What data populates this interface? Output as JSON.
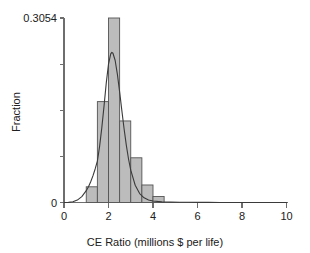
{
  "figure": {
    "background_color": "#ffffff",
    "bar_fill_color": "#bcbcbc",
    "bar_edge_color": "#545454",
    "curve_color": "#3a3a3a",
    "axis_color": "#6e6e6e"
  },
  "axes": {
    "x_title": "CE Ratio (millions $ per life)",
    "y_title": "Fraction",
    "x_ticks": [
      {
        "value": 0,
        "label": "0"
      },
      {
        "value": 2,
        "label": "2"
      },
      {
        "value": 4,
        "label": "4"
      },
      {
        "value": 6,
        "label": "6"
      },
      {
        "value": 8,
        "label": "8"
      },
      {
        "value": 10,
        "label": "10"
      }
    ],
    "y_ticks": [
      {
        "value": 0,
        "label": "0"
      },
      {
        "value": 0.07635,
        "label": ""
      },
      {
        "value": 0.1527,
        "label": ""
      },
      {
        "value": 0.22905,
        "label": ""
      },
      {
        "value": 0.3054,
        "label": "0.3054"
      }
    ],
    "y_max_label": "0.3054",
    "y_min_label": "0"
  },
  "chart_data": {
    "type": "bar",
    "title": "",
    "xlabel": "CE Ratio (millions $ per life)",
    "ylabel": "Fraction",
    "xlim": [
      0,
      10
    ],
    "ylim": [
      0,
      0.3054
    ],
    "grid": false,
    "legend": "none",
    "bin_width": 0.5,
    "x_tick_labels": [
      "0",
      "2",
      "4",
      "6",
      "8",
      "10"
    ],
    "y_tick_labels": [
      "0",
      "",
      "",
      "",
      "0.3054"
    ],
    "bins": [
      {
        "x_start": 1.0,
        "x_end": 1.5,
        "center": 1.25,
        "fraction": 0.026
      },
      {
        "x_start": 1.5,
        "x_end": 2.0,
        "center": 1.75,
        "fraction": 0.167
      },
      {
        "x_start": 2.0,
        "x_end": 2.5,
        "center": 2.25,
        "fraction": 0.3054
      },
      {
        "x_start": 2.5,
        "x_end": 3.0,
        "center": 2.75,
        "fraction": 0.135
      },
      {
        "x_start": 3.0,
        "x_end": 3.5,
        "center": 3.25,
        "fraction": 0.074
      },
      {
        "x_start": 3.5,
        "x_end": 4.0,
        "center": 3.75,
        "fraction": 0.029
      },
      {
        "x_start": 4.0,
        "x_end": 4.5,
        "center": 4.25,
        "fraction": 0.01
      }
    ],
    "categories": [
      "1.25",
      "1.75",
      "2.25",
      "2.75",
      "3.25",
      "3.75",
      "4.25"
    ],
    "values": [
      0.026,
      0.167,
      0.3054,
      0.135,
      0.074,
      0.029,
      0.01
    ],
    "overlay_curve": {
      "name": "fitted density",
      "type": "line",
      "peak_x": 2.15,
      "peak_y": 0.2485,
      "x": [
        0.0,
        0.2,
        0.4,
        0.6,
        0.8,
        1.0,
        1.1,
        1.2,
        1.3,
        1.4,
        1.5,
        1.6,
        1.7,
        1.8,
        1.9,
        2.0,
        2.1,
        2.15,
        2.2,
        2.3,
        2.4,
        2.5,
        2.6,
        2.7,
        2.8,
        2.9,
        3.0,
        3.2,
        3.4,
        3.6,
        3.8,
        4.0,
        4.4,
        4.8,
        5.2,
        5.6,
        6.0,
        6.5,
        7.0,
        7.5,
        8.0,
        8.5,
        9.0,
        9.5,
        10.0
      ],
      "y": [
        0.0,
        0.0002,
        0.0012,
        0.004,
        0.0098,
        0.0196,
        0.0262,
        0.0343,
        0.044,
        0.0555,
        0.0686,
        0.093,
        0.124,
        0.16,
        0.198,
        0.229,
        0.246,
        0.2485,
        0.247,
        0.235,
        0.212,
        0.183,
        0.152,
        0.122,
        0.095,
        0.072,
        0.0535,
        0.0285,
        0.0148,
        0.0078,
        0.0042,
        0.0024,
        0.0011,
        0.0006,
        0.0004,
        0.0003,
        0.0002,
        0.00015,
        0.0001,
        8e-05,
        6e-05,
        5e-05,
        4e-05,
        3e-05,
        2e-05
      ]
    }
  }
}
